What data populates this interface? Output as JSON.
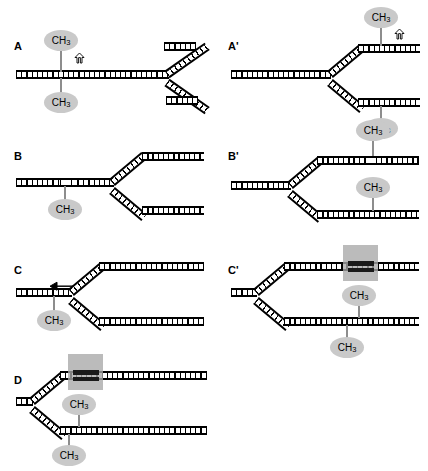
{
  "figure": {
    "colors": {
      "methyl_fill": "#c9c9c9",
      "highlight_box": "#a8a8a8",
      "dark_block": "#1a1a1a",
      "strand": "#000000",
      "background": "#ffffff"
    }
  },
  "panels": [
    {
      "id": "A",
      "label": "A",
      "methyls": [
        {
          "id": "A-top",
          "text": "CH",
          "sub": "3",
          "position": "above-parent-strand"
        },
        {
          "id": "A-bottom",
          "text": "CH",
          "sub": "3",
          "position": "below-parent-strand"
        }
      ],
      "markers": [
        {
          "id": "A-uparrow",
          "icon": "up-arrow-icon"
        }
      ],
      "highlight_boxes": [],
      "description": "Fully methylated parental duplex with a replication fork at the right; symmetric CpG methylation on both strands."
    },
    {
      "id": "A'",
      "label": "A'",
      "methyls": [
        {
          "id": "Ap-top",
          "text": "CH",
          "sub": "3",
          "position": "above-upper-daughter-strand"
        },
        {
          "id": "Ap-bottom",
          "text": "CH",
          "sub": "3",
          "position": "below-lower-daughter-strand"
        }
      ],
      "markers": [
        {
          "id": "Ap-uparrow",
          "icon": "up-arrow-icon"
        }
      ],
      "highlight_boxes": [],
      "description": "Fork advanced; methyl marks now carried on the two daughter duplexes."
    },
    {
      "id": "B",
      "label": "B",
      "methyls": [
        {
          "id": "B-bottom",
          "text": "CH",
          "sub": "3",
          "position": "below-parent-strand"
        }
      ],
      "markers": [],
      "highlight_boxes": [],
      "description": "Hemimethylated parental duplex; unmethylated segment shown with thin rungs."
    },
    {
      "id": "B'",
      "label": "B'",
      "methyls": [
        {
          "id": "Bp-top",
          "text": "CH",
          "sub": "3",
          "position": "above-upper-daughter-strand"
        },
        {
          "id": "Bp-mid",
          "text": "CH",
          "sub": "3",
          "position": "above-lower-daughter-strand"
        }
      ],
      "markers": [],
      "highlight_boxes": [],
      "description": "Fork advanced; hemimethylated patch retained on the upper daughter duplex."
    },
    {
      "id": "C",
      "label": "C",
      "methyls": [
        {
          "id": "C-bottom",
          "text": "CH",
          "sub": "3",
          "position": "below-parent-strand"
        }
      ],
      "markers": [
        {
          "id": "C-leftarrow",
          "icon": "left-arrow-icon"
        }
      ],
      "highlight_boxes": [],
      "description": "Parental duplex with a single methyl group and a leftward arrow indicating direction of movement."
    },
    {
      "id": "C'",
      "label": "C'",
      "methyls": [
        {
          "id": "Cp-mid",
          "text": "CH",
          "sub": "3",
          "position": "between-daughter-strands"
        },
        {
          "id": "Cp-bottom",
          "text": "CH",
          "sub": "3",
          "position": "below-lower-daughter-strand"
        }
      ],
      "markers": [],
      "highlight_boxes": [
        {
          "id": "Cp-box",
          "on": "upper-daughter-strand",
          "contains": "dark-bound-block"
        }
      ],
      "description": "Fork advanced; grey box marks a bound/darkened region on the upper daughter duplex."
    },
    {
      "id": "D",
      "label": "D",
      "methyls": [
        {
          "id": "D-mid",
          "text": "CH",
          "sub": "3",
          "position": "between-daughter-strands"
        },
        {
          "id": "D-bottom",
          "text": "CH",
          "sub": "3",
          "position": "below-lower-daughter-strand"
        }
      ],
      "markers": [],
      "highlight_boxes": [
        {
          "id": "D-box",
          "on": "upper-daughter-strand",
          "contains": "dark-bound-block"
        }
      ],
      "description": "Fork at far left; grey box with dark bound block near the fork on the upper daughter duplex."
    }
  ]
}
